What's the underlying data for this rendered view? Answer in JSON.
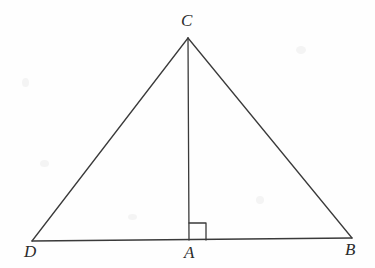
{
  "figure": {
    "kind": "geometry-diagram",
    "background_color": "#fefefe",
    "stroke_color": "#3a3a3a",
    "label_color": "#2b2b2b",
    "stroke_width": 1.3,
    "points": {
      "C": {
        "label": "C",
        "x": 188,
        "y": 38
      },
      "D": {
        "label": "D",
        "x": 32,
        "y": 241
      },
      "B": {
        "label": "B",
        "x": 352,
        "y": 238
      },
      "A": {
        "label": "A",
        "x": 189,
        "y": 240
      }
    },
    "segments": [
      {
        "name": "segment-DC",
        "from": "D",
        "to": "C"
      },
      {
        "name": "segment-CB",
        "from": "C",
        "to": "B"
      },
      {
        "name": "segment-DB",
        "from": "D",
        "to": "B"
      },
      {
        "name": "segment-CA-altitude",
        "from": "C",
        "to": "A"
      }
    ],
    "right_angle": {
      "at": "A",
      "size": 17,
      "opens_toward": "B",
      "marks_angle": "C A B = 90 degrees"
    }
  }
}
